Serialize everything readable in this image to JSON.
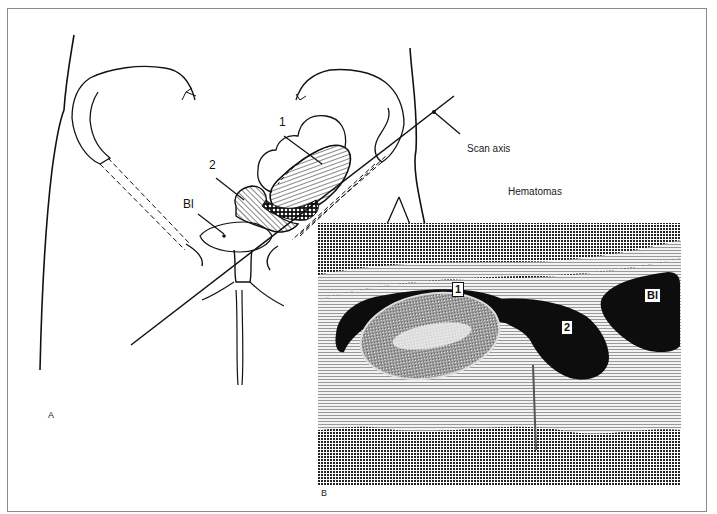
{
  "figure": {
    "panel_a": {
      "letter": "A",
      "labels": {
        "hematoma_1": "1",
        "hematoma_2": "2",
        "bladder": "Bl",
        "scan_axis": "Scan axis"
      }
    },
    "panel_b": {
      "letter": "B",
      "title_label": "Hematomas",
      "labels": {
        "hematoma_1": "1",
        "hematoma_2": "2",
        "bladder": "Bl"
      }
    },
    "colors": {
      "ink": "#111111",
      "frame": "#8a8a8a",
      "background": "#ffffff",
      "ultrasound_dark": "#0d0d0d",
      "ultrasound_mid": "#6e6e6e",
      "ultrasound_light": "#d9d9d9"
    }
  }
}
